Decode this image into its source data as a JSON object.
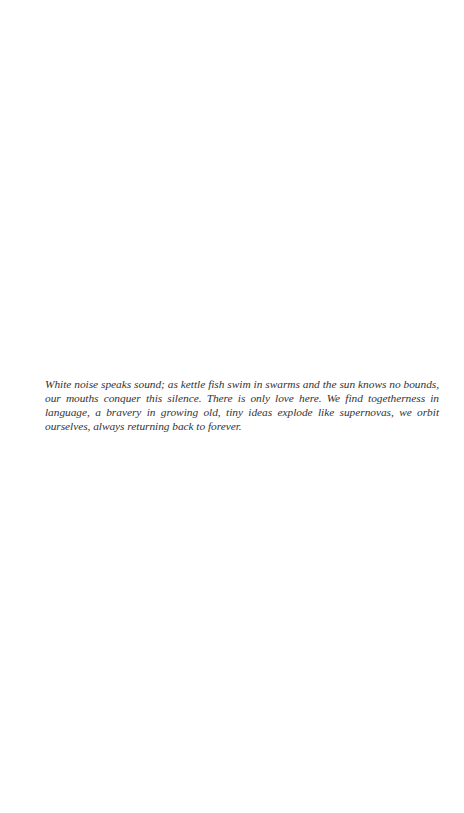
{
  "page": {
    "background_color": "#ffffff",
    "text_color": "#333333"
  },
  "poem": {
    "text": "White noise speaks sound; as kettle fish swim in swarms and the sun knows no bounds, our mouths conquer this silence. There is only love here. We find togetherness in language, a bravery in growing old, tiny ideas explode like supernovas, we orbit ourselves, always returning back to forever."
  }
}
